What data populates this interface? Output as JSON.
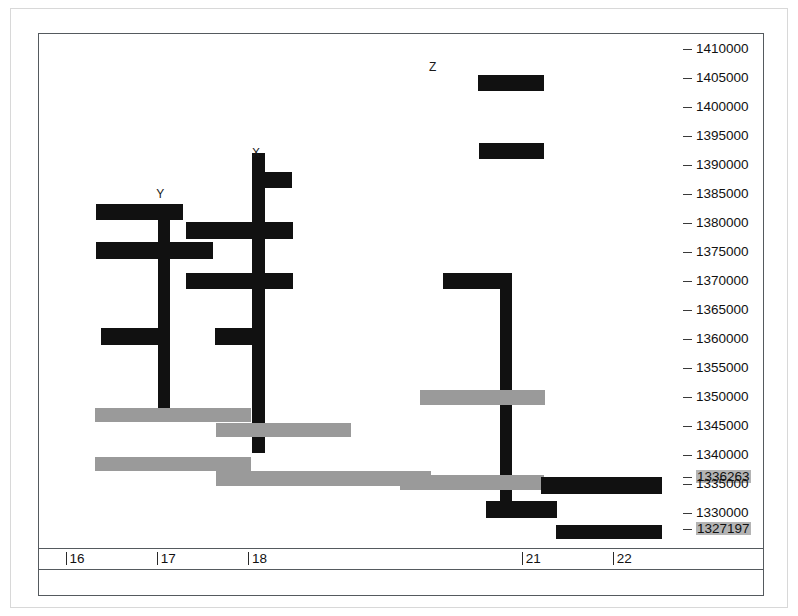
{
  "chart_data": {
    "type": "bar",
    "title": "",
    "subtitle": "",
    "xlabel": "",
    "ylabel": "",
    "orientation": "horizontal-genome-track",
    "grid": false,
    "legend_position": "none",
    "xlim": [
      15.72,
      22.78
    ],
    "ylim": [
      1325500,
      1412500
    ],
    "x_ticks": [
      16,
      17,
      18,
      21,
      22
    ],
    "x_tick_labels": [
      "16",
      "17",
      "18",
      "21",
      "22"
    ],
    "y_ticks": [
      1410000,
      1405000,
      1400000,
      1395000,
      1390000,
      1385000,
      1380000,
      1375000,
      1370000,
      1365000,
      1360000,
      1355000,
      1350000,
      1345000,
      1340000,
      1336263,
      1335000,
      1330000,
      1327197
    ],
    "y_tick_labels": [
      "1410000",
      "1405000",
      "1400000",
      "1395000",
      "1390000",
      "1385000",
      "1380000",
      "1375000",
      "1370000",
      "1365000",
      "1360000",
      "1355000",
      "1350000",
      "1345000",
      "1340000",
      "1336263",
      "1335000",
      "1330000",
      "1327197"
    ],
    "y_tick_highlighted": [
      false,
      false,
      false,
      false,
      false,
      false,
      false,
      false,
      false,
      false,
      false,
      false,
      false,
      false,
      false,
      true,
      false,
      false,
      true
    ],
    "colors": {
      "primary": "#111111",
      "secondary": "#9a9a9a",
      "axis": "#555a5e",
      "highlight_background": "#b4b4b4",
      "page_border": "#d8d8d8",
      "background": "#ffffff"
    },
    "annotations": [
      {
        "text": "Z",
        "x": 20.04,
        "y": 1406800
      },
      {
        "text": "X",
        "x": 18.1,
        "y": 1392000
      },
      {
        "text": "Y",
        "x": 17.05,
        "y": 1385000
      }
    ],
    "series": [
      {
        "name": "primary",
        "color": "#111111",
        "label": "black-features"
      },
      {
        "name": "secondary",
        "color": "#9a9a9a",
        "label": "gray-features"
      }
    ],
    "features": [
      {
        "id": "z-bar",
        "color": "primary",
        "x0": 20.53,
        "x1": 21.26,
        "y_top": 1405400,
        "y_bottom": 1402600
      },
      {
        "id": "bar-b",
        "color": "primary",
        "x0": 20.54,
        "x1": 21.26,
        "y_top": 1393700,
        "y_bottom": 1390900
      },
      {
        "id": "x-stem",
        "color": "primary",
        "x0": 18.06,
        "x1": 18.2,
        "y_top": 1392000,
        "y_bottom": 1340300
      },
      {
        "id": "x-arm-1",
        "color": "primary",
        "x0": 18.13,
        "x1": 18.49,
        "y_top": 1388700,
        "y_bottom": 1386000
      },
      {
        "id": "y-top-arm",
        "color": "primary",
        "x0": 16.34,
        "x1": 17.3,
        "y_top": 1383200,
        "y_bottom": 1380400
      },
      {
        "id": "y-stem",
        "color": "primary",
        "x0": 17.03,
        "x1": 17.16,
        "y_top": 1381700,
        "y_bottom": 1347000
      },
      {
        "id": "x-arm-2",
        "color": "primary",
        "x0": 17.33,
        "x1": 18.5,
        "y_top": 1380100,
        "y_bottom": 1377200
      },
      {
        "id": "y-arm-2",
        "color": "primary",
        "x0": 16.34,
        "x1": 17.63,
        "y_top": 1376700,
        "y_bottom": 1373800
      },
      {
        "id": "x-arm-3",
        "color": "primary",
        "x0": 17.33,
        "x1": 18.51,
        "y_top": 1371400,
        "y_bottom": 1368500
      },
      {
        "id": "r-arm-top",
        "color": "primary",
        "x0": 20.15,
        "x1": 20.9,
        "y_top": 1371400,
        "y_bottom": 1368500
      },
      {
        "id": "r-stem",
        "color": "primary",
        "x0": 20.77,
        "x1": 20.91,
        "y_top": 1370000,
        "y_bottom": 1331300
      },
      {
        "id": "y-arm-3",
        "color": "primary",
        "x0": 16.4,
        "x1": 17.15,
        "y_top": 1361800,
        "y_bottom": 1358900
      },
      {
        "id": "x-arm-4",
        "color": "primary",
        "x0": 17.65,
        "x1": 18.2,
        "y_top": 1361800,
        "y_bottom": 1358900
      },
      {
        "id": "gray-top-r",
        "color": "secondary",
        "x0": 19.9,
        "x1": 21.27,
        "y_top": 1351100,
        "y_bottom": 1348600
      },
      {
        "id": "gray-1",
        "color": "secondary",
        "x0": 16.33,
        "x1": 18.04,
        "y_top": 1348100,
        "y_bottom": 1345600
      },
      {
        "id": "gray-2",
        "color": "secondary",
        "x0": 17.66,
        "x1": 19.14,
        "y_top": 1345500,
        "y_bottom": 1343000
      },
      {
        "id": "gray-3",
        "color": "secondary",
        "x0": 16.33,
        "x1": 18.04,
        "y_top": 1339700,
        "y_bottom": 1337200
      },
      {
        "id": "gray-4",
        "color": "secondary",
        "x0": 17.66,
        "x1": 20.02,
        "y_top": 1337200,
        "y_bottom": 1334700
      },
      {
        "id": "gray-5",
        "color": "secondary",
        "x0": 19.68,
        "x1": 21.26,
        "y_top": 1336500,
        "y_bottom": 1334000
      },
      {
        "id": "bar-br-1",
        "color": "primary",
        "x0": 21.22,
        "x1": 22.55,
        "y_top": 1336200,
        "y_bottom": 1333300
      },
      {
        "id": "r-foot",
        "color": "primary",
        "x0": 20.62,
        "x1": 21.4,
        "y_top": 1332000,
        "y_bottom": 1329100
      },
      {
        "id": "bar-br-2",
        "color": "primary",
        "x0": 21.39,
        "x1": 22.55,
        "y_top": 1327900,
        "y_bottom": 1325100
      }
    ]
  }
}
